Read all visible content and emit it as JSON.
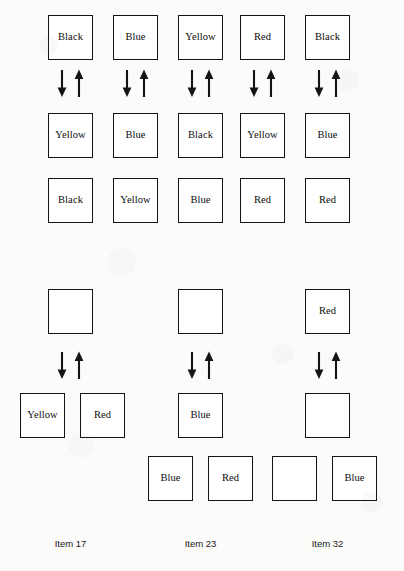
{
  "figure": {
    "type": "box-transition-diagram",
    "box_size": 45,
    "groups": [
      {
        "id": "group-top",
        "section": "upper",
        "rows": [
          {
            "id": "upper-row-1",
            "y": 15,
            "cells": [
              {
                "label": "Black",
                "x": 48
              },
              {
                "label": "Blue",
                "x": 113
              },
              {
                "label": "Yellow",
                "x": 178
              },
              {
                "label": "Red",
                "x": 240
              },
              {
                "label": "Black",
                "x": 305
              }
            ]
          },
          {
            "id": "upper-row-2",
            "y": 113,
            "cells": [
              {
                "label": "Yellow",
                "x": 48
              },
              {
                "label": "Blue",
                "x": 113
              },
              {
                "label": "Black",
                "x": 178
              },
              {
                "label": "Yellow",
                "x": 240
              },
              {
                "label": "Blue",
                "x": 305
              }
            ]
          },
          {
            "id": "upper-row-3",
            "y": 178,
            "cells": [
              {
                "label": "Black",
                "x": 48
              },
              {
                "label": "Yellow",
                "x": 113
              },
              {
                "label": "Blue",
                "x": 178
              },
              {
                "label": "Red",
                "x": 240
              },
              {
                "label": "Red",
                "x": 305
              }
            ]
          }
        ],
        "arrows": [
          {
            "x": 54,
            "y": 68
          },
          {
            "x": 119,
            "y": 68
          },
          {
            "x": 184,
            "y": 68
          },
          {
            "x": 246,
            "y": 68
          },
          {
            "x": 311,
            "y": 68
          }
        ]
      },
      {
        "id": "group-bottom",
        "section": "lower",
        "rows": [
          {
            "id": "lower-row-1",
            "y": 289,
            "cells": [
              {
                "label": "",
                "x": 48
              },
              {
                "label": "",
                "x": 178
              },
              {
                "label": "Red",
                "x": 305
              }
            ]
          },
          {
            "id": "lower-row-2",
            "y": 393,
            "cells": [
              {
                "label": "Yellow",
                "x": 20
              },
              {
                "label": "Red",
                "x": 80
              },
              {
                "label": "Blue",
                "x": 178
              },
              {
                "label": "",
                "x": 305
              }
            ]
          },
          {
            "id": "lower-row-3",
            "y": 456,
            "cells": [
              {
                "label": "Blue",
                "x": 148
              },
              {
                "label": "Red",
                "x": 208
              },
              {
                "label": "",
                "x": 272
              },
              {
                "label": "Blue",
                "x": 332
              }
            ]
          }
        ],
        "arrows": [
          {
            "x": 54,
            "y": 350
          },
          {
            "x": 184,
            "y": 350
          },
          {
            "x": 311,
            "y": 350
          }
        ]
      }
    ],
    "item_labels": [
      {
        "text": "Item 17",
        "x": 48,
        "y": 538
      },
      {
        "text": "Item 23",
        "x": 178,
        "y": 538
      },
      {
        "text": "Item 32",
        "x": 305,
        "y": 538
      }
    ],
    "colors": {
      "ink": "#141414",
      "paper": "#fbfbfa",
      "box_fill": "#ffffff"
    },
    "arrow_icon": {
      "down": "arrow-down-icon",
      "up": "arrow-up-icon"
    }
  }
}
